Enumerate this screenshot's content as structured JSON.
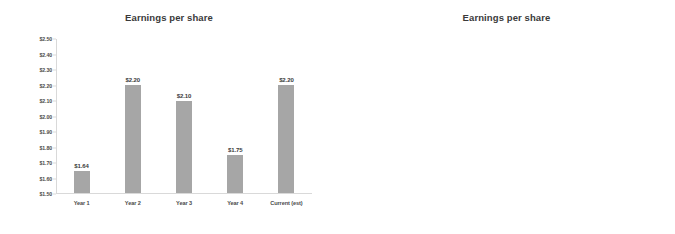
{
  "charts": [
    {
      "id": "left",
      "title": "Earnings per share",
      "y_ticks": [
        "$2.50",
        "$2.40",
        "$2.30",
        "$2.20",
        "$2.10",
        "$2.00",
        "$1.90",
        "$1.80",
        "$1.70",
        "$1.60",
        "$1.50"
      ],
      "y_min": 1.5,
      "y_max": 2.5,
      "categories": [
        "Year 1",
        "Year 2",
        "Year 3",
        "Year 4",
        "Current (est)"
      ],
      "values": [
        1.64,
        2.2,
        2.1,
        1.75,
        2.2
      ],
      "value_labels": [
        "$1.64",
        "$2.20",
        "$2.10",
        "$1.75",
        "$2.20"
      ],
      "bar_color": "#a6a6a6"
    },
    {
      "id": "right",
      "title": "Earnings per share",
      "y_ticks": [
        "$2.50",
        "$0.00"
      ],
      "y_min": 0.0,
      "y_max": 2.5,
      "categories": [
        "Year 1",
        "Year 2",
        "Year 3",
        "Year 4",
        "Current (est)"
      ],
      "values": [
        1.64,
        2.2,
        2.1,
        1.75,
        2.2
      ],
      "value_labels": [
        "$1.64",
        "$2.20",
        "$2.10",
        "$1.75",
        "$2.20"
      ],
      "bar_color": "#a6a6a6"
    }
  ],
  "chart_data": [
    {
      "type": "bar",
      "title": "Earnings per share",
      "xlabel": "",
      "ylabel": "",
      "categories": [
        "Year 1",
        "Year 2",
        "Year 3",
        "Year 4",
        "Current (est)"
      ],
      "values": [
        1.64,
        2.2,
        2.1,
        1.75,
        2.2
      ],
      "data_labels": [
        "$1.64",
        "$2.20",
        "$2.10",
        "$1.75",
        "$2.20"
      ],
      "ylim": [
        1.5,
        2.5
      ],
      "ytick_labels": [
        "$1.50",
        "$1.60",
        "$1.70",
        "$1.80",
        "$1.90",
        "$2.00",
        "$2.10",
        "$2.20",
        "$2.30",
        "$2.40",
        "$2.50"
      ],
      "ytick_step": 0.1,
      "grid": false,
      "legend": false,
      "bar_color": "#a6a6a6"
    },
    {
      "type": "bar",
      "title": "Earnings per share",
      "xlabel": "",
      "ylabel": "",
      "categories": [
        "Year 1",
        "Year 2",
        "Year 3",
        "Year 4",
        "Current (est)"
      ],
      "values": [
        1.64,
        2.2,
        2.1,
        1.75,
        2.2
      ],
      "data_labels": [
        "$1.64",
        "$2.20",
        "$2.10",
        "$1.75",
        "$2.20"
      ],
      "ylim": [
        0.0,
        2.5
      ],
      "ytick_labels": [
        "$0.00",
        "$2.50"
      ],
      "grid": false,
      "legend": false,
      "bar_color": "#a6a6a6"
    }
  ]
}
